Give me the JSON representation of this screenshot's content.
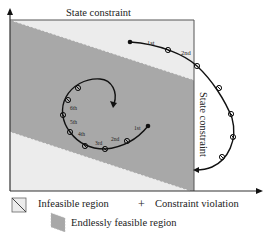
{
  "diagram": {
    "top_label": "State constraint",
    "right_label": "State constraint",
    "outer_trajectory_labels": [
      "1st",
      "2nd"
    ],
    "inner_trajectory_labels": [
      "1st",
      "2nd",
      "3rd",
      "4th",
      "5th",
      "6th"
    ],
    "colors": {
      "infeasible": "#ececec",
      "feasible": "#a8a8a8",
      "trajectory": "#111111",
      "axis": "#333333"
    }
  },
  "legend": {
    "infeasible": "Infeasible region",
    "violation_symbol": "+",
    "violation": "Constraint violation",
    "feasible": "Endlessly feasible region"
  }
}
